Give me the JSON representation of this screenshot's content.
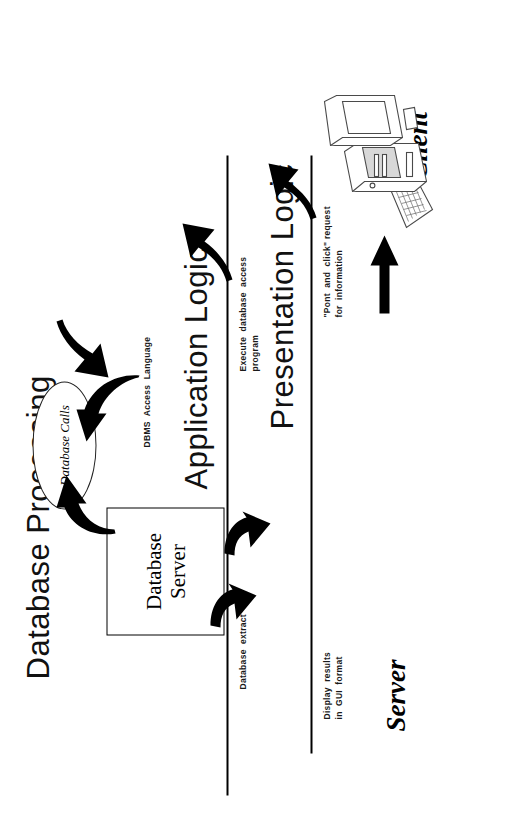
{
  "diagram": {
    "tiers": [
      {
        "id": "database-processing",
        "label": "Database Processing"
      },
      {
        "id": "application-logic",
        "label": "Application  Logic"
      },
      {
        "id": "presentation-logic",
        "label": "Presentation Logic"
      }
    ],
    "zones": [
      {
        "id": "server",
        "label": "Server"
      },
      {
        "id": "client",
        "label": "Client"
      }
    ],
    "nodes": [
      {
        "id": "database-calls",
        "label": "Database Calls",
        "shape": "ellipse"
      },
      {
        "id": "database-server",
        "label": "Database\nServer",
        "shape": "rectangle"
      },
      {
        "id": "client-workstation",
        "label": "",
        "shape": "computer-illustration"
      }
    ],
    "flow_labels": [
      {
        "id": "dbms-access-language",
        "text": "DBMS  Access  Language"
      },
      {
        "id": "execute-database-access",
        "text": "Execute  database  access\nprogram"
      },
      {
        "id": "point-and-click-request",
        "text": "\"Pont  and  click\" request\nfor  information"
      },
      {
        "id": "database-extract",
        "text": "Database  extract"
      },
      {
        "id": "display-results-gui",
        "text": "Display  results\nin  GUI  format"
      }
    ],
    "colors": {
      "ink": "#000000",
      "background": "#ffffff",
      "line_art": "#4a4a4a"
    }
  }
}
